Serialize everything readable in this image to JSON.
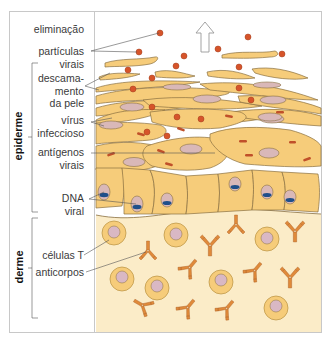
{
  "diagram": {
    "layers": [
      {
        "id": "epidermis",
        "label": "epiderme"
      },
      {
        "id": "dermis",
        "label": "derme"
      }
    ],
    "labels": {
      "shedding": "eliminação",
      "viral_particles_1": "partículas",
      "viral_particles_2": "virais",
      "desquamation_1": "descama-",
      "desquamation_2": "mento",
      "desquamation_3": "da pele",
      "infectious_virus_1": "vírus",
      "infectious_virus_2": "infeccioso",
      "viral_antigens_1": "antígenos",
      "viral_antigens_2": "virais",
      "viral_dna_1": "DNA",
      "viral_dna_2": "viral",
      "t_cells": "células T",
      "antibodies": "anticorpos"
    },
    "colors": {
      "cell_fill": "#f6cc7a",
      "cell_stroke": "#8a7040",
      "nucleus_fill": "#d9b8b8",
      "virus_particle": "#d6542a",
      "viral_dna": "#1f4f8a",
      "dermis_bg": "#fbecc8",
      "antibody": "#e08a3a",
      "t_cell_outer": "#f6cc7a",
      "t_cell_nucleus": "#d9b8c4"
    }
  }
}
